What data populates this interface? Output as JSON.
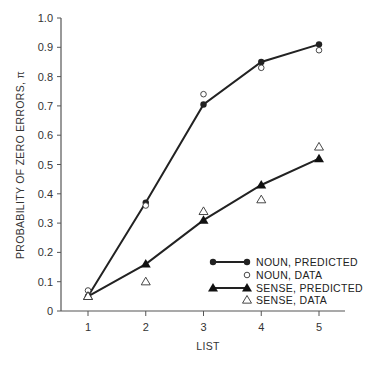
{
  "chart_data": {
    "type": "line",
    "title": "",
    "xlabel": "LIST",
    "ylabel": "PROBABILITY OF ZERO ERRORS, π",
    "x": [
      1,
      2,
      3,
      4,
      5
    ],
    "xlim": [
      0.5,
      5.5
    ],
    "ylim": [
      0,
      1.0
    ],
    "xticks": [
      "1",
      "2",
      "3",
      "4",
      "5"
    ],
    "yticks": [
      "0",
      "0.1",
      "0.2",
      "0.3",
      "0.4",
      "0.5",
      "0.6",
      "0.7",
      "0.8",
      "0.9",
      "1.0"
    ],
    "grid": false,
    "legend_position": "bottom-right",
    "series": [
      {
        "name": "NOUN, PREDICTED",
        "marker": "filled-circle",
        "line": true,
        "values": [
          0.05,
          0.37,
          0.705,
          0.85,
          0.91
        ]
      },
      {
        "name": "NOUN, DATA",
        "marker": "open-circle",
        "line": false,
        "values": [
          0.07,
          0.36,
          0.74,
          0.83,
          0.89
        ]
      },
      {
        "name": "SENSE, PREDICTED",
        "marker": "filled-triangle",
        "line": true,
        "values": [
          0.05,
          0.16,
          0.31,
          0.43,
          0.52
        ]
      },
      {
        "name": "SENSE, DATA",
        "marker": "open-triangle",
        "line": false,
        "values": [
          0.05,
          0.1,
          0.34,
          0.38,
          0.56
        ]
      }
    ]
  }
}
